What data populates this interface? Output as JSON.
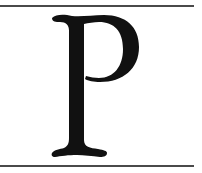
{
  "image": {
    "letter": "P",
    "letter_color": "#111111",
    "rule_color": "#4a4a4a",
    "background": "#ffffff"
  }
}
